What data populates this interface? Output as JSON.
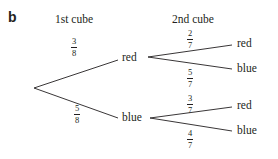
{
  "part_label": "b",
  "headers": {
    "first": "1st cube",
    "second": "2nd cube"
  },
  "first_level": {
    "red": {
      "label": "red",
      "prob": {
        "num": "3",
        "den": "8"
      }
    },
    "blue": {
      "label": "blue",
      "prob": {
        "num": "5",
        "den": "8"
      }
    }
  },
  "second_level": {
    "after_red": {
      "red": {
        "label": "red",
        "prob": {
          "num": "2",
          "den": "7"
        }
      },
      "blue": {
        "label": "blue",
        "prob": {
          "num": "5",
          "den": "7"
        }
      }
    },
    "after_blue": {
      "red": {
        "label": "red",
        "prob": {
          "num": "3",
          "den": "7"
        }
      },
      "blue": {
        "label": "blue",
        "prob": {
          "num": "4",
          "den": "7"
        }
      }
    }
  },
  "colors": {
    "ink": "#231f20",
    "background": "#ffffff"
  }
}
